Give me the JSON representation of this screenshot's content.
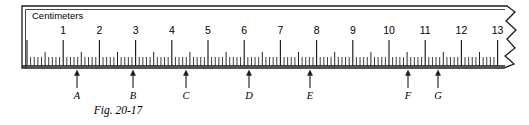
{
  "figure": {
    "caption": "Fig. 20-17",
    "unit_label": "Centimeters",
    "caption_x": 118,
    "caption_y": 114
  },
  "ruler": {
    "x_origin": 27,
    "px_per_cm": 36.2,
    "body_top": 6,
    "body_bottom": 68,
    "left_edge": 22,
    "break_x": 503,
    "baseline_y": 66,
    "tick_heights": {
      "cm": 26,
      "half_cm": 14,
      "mm": 9
    },
    "number_label_y": 34,
    "unit_label_x": 32,
    "unit_label_y": 19,
    "stroke": "#1a1a1a",
    "background": "#ffffff"
  },
  "chart_data": {
    "type": "table",
    "title": "Fig. 20-17",
    "xlabel": "Centimeters",
    "axis_range_cm": [
      0,
      13
    ],
    "major_tick_interval_cm": 1,
    "minor_tick_interval_cm": 0.1,
    "tick_labels": [
      "1",
      "2",
      "3",
      "4",
      "5",
      "6",
      "7",
      "8",
      "9",
      "10",
      "11",
      "12",
      "13"
    ],
    "tick_values_cm": [
      1,
      2,
      3,
      4,
      5,
      6,
      7,
      8,
      9,
      10,
      11,
      12,
      13
    ],
    "grid": false,
    "legend": "none",
    "categories": [
      "A",
      "B",
      "C",
      "D",
      "E",
      "F",
      "G"
    ],
    "values": [
      1.4,
      2.95,
      4.4,
      6.15,
      7.85,
      10.55,
      11.4
    ],
    "series": [
      {
        "name": "Pointer positions (cm)",
        "values": [
          1.4,
          2.95,
          4.4,
          6.15,
          7.85,
          10.55,
          11.4
        ]
      }
    ]
  },
  "pointers": [
    {
      "label": "A",
      "x": 77,
      "reading_cm": 1.4
    },
    {
      "label": "B",
      "x": 133,
      "reading_cm": 2.95
    },
    {
      "label": "C",
      "x": 186,
      "reading_cm": 4.4
    },
    {
      "label": "D",
      "x": 249,
      "reading_cm": 6.15
    },
    {
      "label": "E",
      "x": 310,
      "reading_cm": 7.85
    },
    {
      "label": "F",
      "x": 408,
      "reading_cm": 10.55
    },
    {
      "label": "G",
      "x": 438,
      "reading_cm": 11.4
    }
  ],
  "pointer_geometry": {
    "arrow_tip_y": 70,
    "arrow_tail_y": 88,
    "label_y": 99,
    "head_half_width": 2.6,
    "head_length": 5.5
  }
}
